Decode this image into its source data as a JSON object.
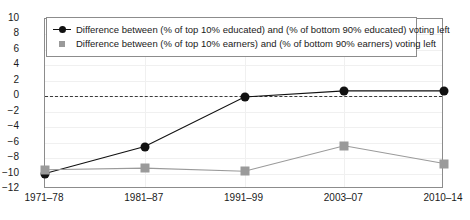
{
  "chart_data": {
    "type": "line",
    "title": "",
    "subtitle": "",
    "xlabel": "",
    "ylabel": "",
    "categories": [
      "1971–78",
      "1981–87",
      "1991–99",
      "2003–07",
      "2010–14"
    ],
    "ylim": [
      -12,
      10
    ],
    "yticks": [
      "10",
      "8",
      "6",
      "4",
      "2",
      "0",
      "−2",
      "−4",
      "−6",
      "−8",
      "−10",
      "−12"
    ],
    "ytick_values": [
      10,
      8,
      6,
      4,
      2,
      0,
      -2,
      -4,
      -6,
      -8,
      -10,
      -12
    ],
    "grid": true,
    "zero_reference_line": true,
    "legend_position": "upper left inside",
    "series": [
      {
        "name": "Difference between (% of top 10% educated) and (% of bottom 90% educated) voting left",
        "marker": "circle",
        "color": "#111111",
        "values": [
          -10,
          -6.5,
          -0.1,
          0.7,
          0.7
        ]
      },
      {
        "name": "Difference between (% of top 10% earners) and (% of bottom 90% earners) voting left",
        "marker": "square",
        "color": "#9a9a9a",
        "values": [
          -9.5,
          -9.3,
          -9.7,
          -6.4,
          -8.7
        ]
      }
    ]
  },
  "colors": {
    "educated_series": "#111111",
    "earners_series": "#9a9a9a",
    "axis": "#8c8c8c",
    "grid": "#f0f0f0",
    "zero_line": "#3a3a3a"
  }
}
